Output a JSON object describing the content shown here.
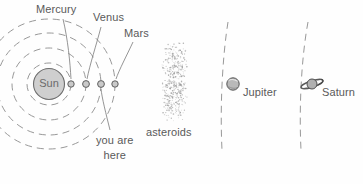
{
  "diagram": {
    "labels": {
      "sun": "Sun",
      "mercury": "Mercury",
      "venus": "Venus",
      "mars": "Mars",
      "asteroids": "asteroids",
      "jupiter": "Jupiter",
      "saturn": "Saturn",
      "you_are": "you are",
      "here": "here"
    },
    "colors": {
      "background": "#fefefe",
      "ink": "#5a5a5a",
      "orbit": "#8c8c8c",
      "sun_fill": "#cfcfcf",
      "sun_stroke": "#6e6e6e",
      "planet_fill": "#c9c9c9",
      "planet_stroke": "#5f5f5f",
      "asteroid": "#9a9a9a",
      "leader": "#7a7a7a"
    },
    "bodies": [
      {
        "name": "Sun",
        "cx": 49,
        "cy": 84,
        "r": 15.5,
        "kind": "star"
      },
      {
        "name": "Mercury",
        "cx": 71,
        "cy": 84,
        "r": 3.2,
        "kind": "planet",
        "orbit_rx": 22,
        "orbit_ry": 21
      },
      {
        "name": "Venus",
        "cx": 86,
        "cy": 84,
        "r": 3.4,
        "kind": "planet",
        "orbit_rx": 37,
        "orbit_ry": 36
      },
      {
        "name": "Earth",
        "cx": 101,
        "cy": 84,
        "r": 3.4,
        "kind": "planet",
        "orbit_rx": 52,
        "orbit_ry": 51
      },
      {
        "name": "Mars",
        "cx": 115,
        "cy": 84,
        "r": 3.2,
        "kind": "planet",
        "orbit_rx": 66,
        "orbit_ry": 65
      },
      {
        "name": "Jupiter",
        "cx": 233,
        "cy": 84,
        "r": 6.2,
        "kind": "planet"
      },
      {
        "name": "Saturn",
        "cx": 312,
        "cy": 84,
        "r": 5.0,
        "kind": "ringed-planet"
      }
    ],
    "asteroid_belt": {
      "x_min": 162,
      "x_max": 187,
      "y_min": 43,
      "y_max": 121,
      "count": 430
    },
    "outer_orbits": [
      {
        "name": "jupiter-orbit",
        "x_top": 228,
        "y_top": 22,
        "x_bottom": 222,
        "y_bottom": 150
      },
      {
        "name": "saturn-orbit",
        "x_top": 308,
        "y_top": 22,
        "x_bottom": 300,
        "y_bottom": 150
      }
    ],
    "leaders": [
      {
        "name": "mercury-leader",
        "from": [
          63,
          18
        ],
        "to": [
          71,
          79
        ]
      },
      {
        "name": "venus-leader",
        "from": [
          101,
          26
        ],
        "to": [
          87,
          79
        ]
      },
      {
        "name": "mars-leader",
        "from": [
          133,
          41
        ],
        "to": [
          116,
          79
        ]
      },
      {
        "name": "here-leader",
        "from": [
          110,
          130
        ],
        "to": [
          101,
          89
        ]
      }
    ]
  }
}
